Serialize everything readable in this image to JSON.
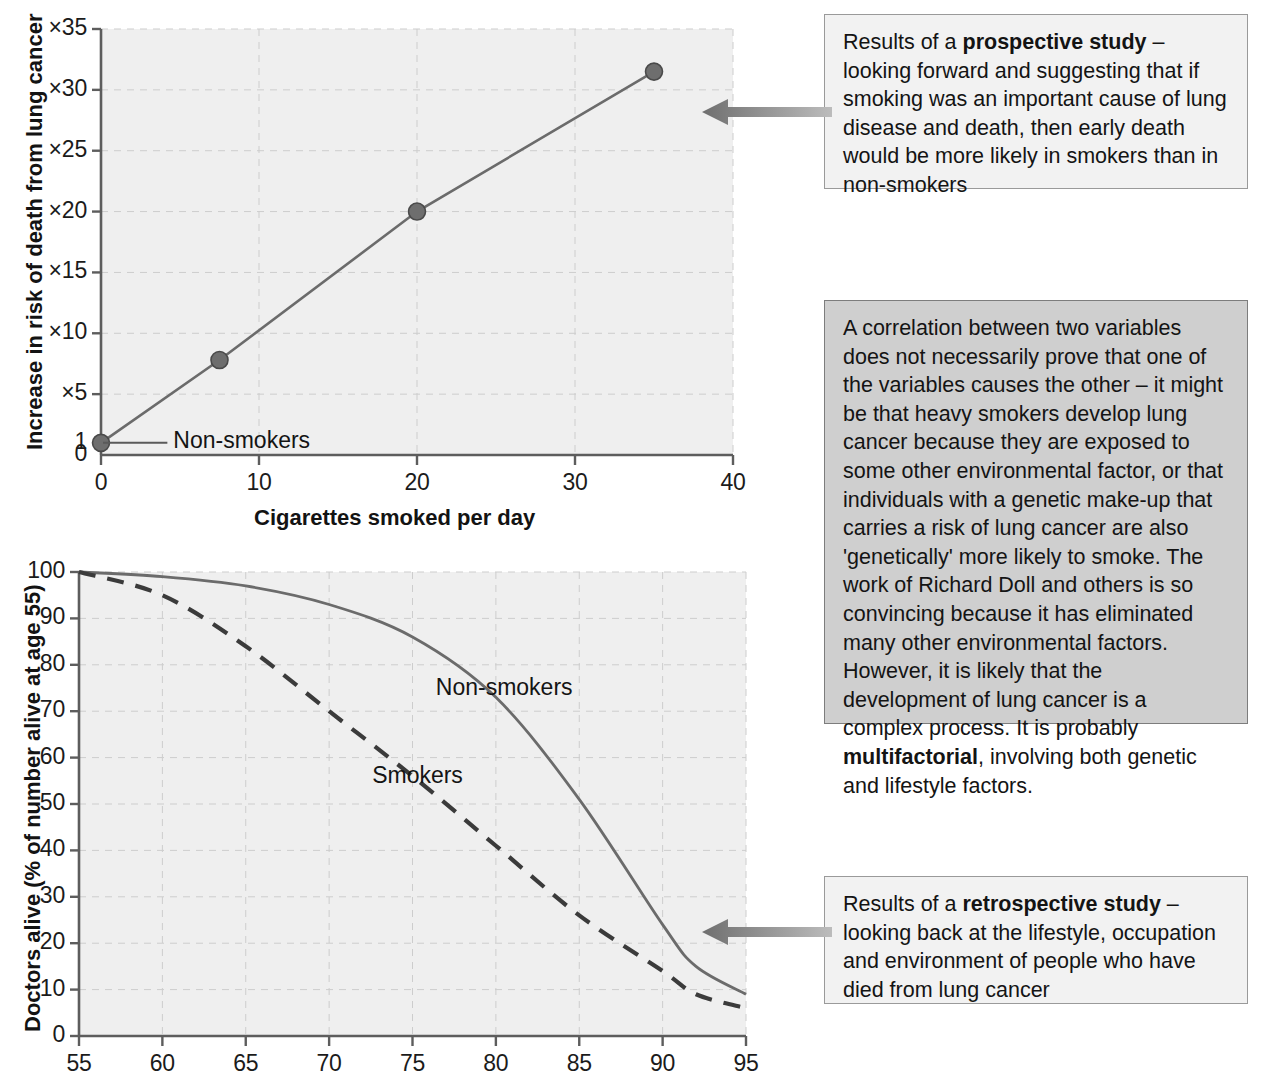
{
  "chart_data": [
    {
      "type": "line",
      "title": "",
      "xlabel": "Cigarettes smoked per day",
      "ylabel": "Increase in risk of death from lung cancer",
      "xlim": [
        0,
        40
      ],
      "ylim": [
        0,
        35
      ],
      "xticks": [
        "0",
        "10",
        "20",
        "30",
        "40"
      ],
      "xtick_values": [
        0,
        10,
        20,
        30,
        40
      ],
      "yticks": [
        "0",
        "1",
        "×5",
        "×10",
        "×15",
        "×20",
        "×25",
        "×30",
        "×35"
      ],
      "ytick_values": [
        0,
        1,
        5,
        10,
        15,
        20,
        25,
        30,
        35
      ],
      "grid": true,
      "series": [
        {
          "name": "Increase in risk",
          "x": [
            0,
            7.5,
            20,
            35
          ],
          "values": [
            1,
            7.8,
            20,
            31.5
          ],
          "marker": "circle",
          "style": "solid"
        }
      ],
      "annotations": [
        {
          "text": "Non-smokers",
          "x": 4.2,
          "y": 1
        }
      ]
    },
    {
      "type": "line",
      "title": "",
      "xlabel": "",
      "ylabel": "Doctors alive (% of number alive at age 55)",
      "xlim": [
        55,
        95
      ],
      "ylim": [
        0,
        100
      ],
      "xticks": [
        "55",
        "60",
        "65",
        "70",
        "75",
        "80",
        "85",
        "90",
        "95"
      ],
      "xtick_values": [
        55,
        60,
        65,
        70,
        75,
        80,
        85,
        90,
        95
      ],
      "yticks": [
        "0",
        "10",
        "20",
        "30",
        "40",
        "50",
        "60",
        "70",
        "80",
        "90",
        "100"
      ],
      "ytick_values": [
        0,
        10,
        20,
        30,
        40,
        50,
        60,
        70,
        80,
        90,
        100
      ],
      "grid": true,
      "series": [
        {
          "name": "Non-smokers",
          "style": "solid",
          "x": [
            55,
            60,
            65,
            70,
            75,
            80,
            85,
            90,
            92,
            95
          ],
          "values": [
            100,
            99,
            97,
            93,
            86,
            73,
            51,
            24,
            15,
            9
          ]
        },
        {
          "name": "Smokers",
          "style": "dashed",
          "x": [
            55,
            60,
            65,
            70,
            75,
            80,
            85,
            90,
            92,
            95
          ],
          "values": [
            100,
            95,
            84,
            70,
            56,
            41,
            26,
            14,
            9,
            6
          ]
        }
      ],
      "annotations": [
        {
          "text": "Non-smokers",
          "x": 80.5,
          "y": 75
        },
        {
          "text": "Smokers",
          "x": 75.3,
          "y": 56
        }
      ]
    }
  ],
  "callouts": {
    "prospective": {
      "name": "prospective-study-note",
      "lines": [
        {
          "text": "Results of a "
        },
        {
          "text": "prospective study",
          "bold": true
        },
        {
          "text": " – looking forward and suggesting that if smoking was an important cause of lung disease and death, then early death would be more likely in smokers than in non-smokers"
        }
      ],
      "plain": "Results of a prospective study – looking forward and suggesting that if smoking was an important cause of lung disease and death, then early death would be more likely in smokers than in non-smokers"
    },
    "correlation": {
      "name": "correlation-note",
      "plain": "A correlation between two variables does not necessarily prove that one of the variables causes the other – it might be that heavy smokers develop lung cancer because they are exposed to some other environmental factor, or that individuals with a genetic make-up that carries a risk of lung cancer are also 'genetically' more likely to smoke. The work of Richard Doll and others is so convincing because it has eliminated many other environmental factors. However, it is likely that the development of lung cancer is a complex process. It is probably multifactorial, involving both genetic and lifestyle factors.",
      "bold_terms": [
        "multifactorial"
      ]
    },
    "retrospective": {
      "name": "retrospective-study-note",
      "plain": "Results of a retrospective study – looking back at the lifestyle, occupation and environment of people who have died from lung cancer",
      "bold_terms": [
        "retrospective study"
      ]
    }
  },
  "colors": {
    "plot_background": "#efefef",
    "axis": "#5d5d5d",
    "line": "#6b6b6b",
    "marker": "#6e6e6e",
    "gridline": "#cdcdcd",
    "callout_light": "#f2f2f2",
    "callout_gray": "#cfcfcf",
    "arrow": "#8a8a8a",
    "text": "#141414"
  },
  "icons": {
    "arrow_top": "left-arrow-icon",
    "arrow_bottom": "left-arrow-icon"
  }
}
